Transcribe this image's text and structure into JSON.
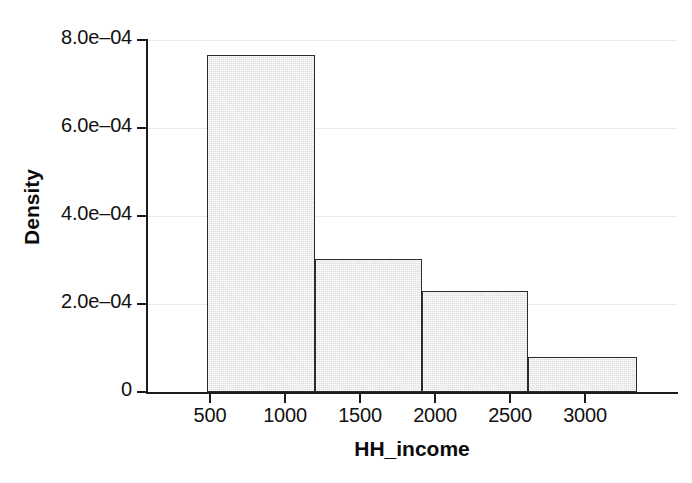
{
  "chart_data": {
    "type": "bar",
    "subtype": "histogram",
    "title": "",
    "subtitle": "",
    "xlabel": "HH_income",
    "ylabel": "Density",
    "grid": true,
    "grid_axis": "y",
    "legend": null,
    "legend_position": "none",
    "xlim": [
      120,
      3720
    ],
    "ylim": [
      0,
      0.0008
    ],
    "bin_width": 730,
    "bin_edges": [
      530,
      1260,
      1990,
      2710,
      3450
    ],
    "categories": [
      "530-1260",
      "1260-1990",
      "1990-2710",
      "2710-3450"
    ],
    "values": [
      0.000766,
      0.000302,
      0.00023,
      7.95e-05
    ],
    "value_labels": [
      "7.66e-04",
      "3.02e-04",
      "2.30e-04",
      "7.95e-05"
    ],
    "xticks": [
      500,
      1000,
      1500,
      2000,
      2500,
      3000
    ],
    "xticklabels": [
      "500",
      "1000",
      "1500",
      "2000",
      "2500",
      "3000"
    ],
    "yticks": [
      0,
      0.0002,
      0.0004,
      0.0006,
      0.0008
    ],
    "yticklabels": [
      "0",
      "2.0e–04",
      "4.0e–04",
      "6.0e–04",
      "8.0e–04"
    ],
    "colors": {
      "bar_fill": "#e9e9e9",
      "bar_edge": "#2b2b2b",
      "axis": "#1c1c1c",
      "grid": "#e9e9ee",
      "text": "#111111",
      "background": "#ffffff"
    }
  },
  "axes": {
    "y_title": "Density",
    "x_title": "HH_income",
    "y_tick_labels": [
      "8.0e–04",
      "6.0e–04",
      "4.0e–04",
      "2.0e–04",
      "0"
    ],
    "x_tick_labels": [
      "500",
      "1000",
      "1500",
      "2000",
      "2500",
      "3000"
    ]
  }
}
